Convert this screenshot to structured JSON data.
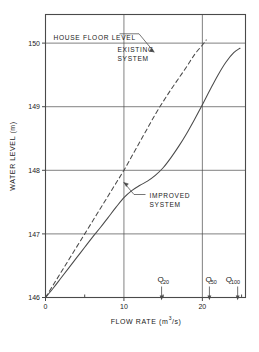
{
  "figure": {
    "background_color": "#ffffff",
    "line_color": "#4a4a4a",
    "text_color": "#1a1a1a"
  },
  "axes": {
    "y_title": "WATER LEVEL (m)",
    "x_title_main": "FLOW RATE (m",
    "x_title_sup": "3",
    "x_title_tail": "/s)",
    "x_ticks": [
      "0",
      "10",
      "20"
    ],
    "y_ticks": [
      "146",
      "147",
      "148",
      "149",
      "150"
    ]
  },
  "annotations": {
    "house_floor": "HOUSE FLOOR LEVEL",
    "existing_line1": "EXISTING",
    "existing_line2": "SYSTEM",
    "improved_line1": "IMPROVED",
    "improved_line2": "SYSTEM",
    "q20_base": "Q",
    "q20_sub": "20",
    "q50_base": "Q",
    "q50_sub": "50",
    "q100_base": "Q",
    "q100_sub": "100"
  },
  "chart_data": {
    "type": "line",
    "title": "",
    "xlabel": "FLOW RATE (m3/s)",
    "ylabel": "WATER LEVEL (m)",
    "xlim": [
      0,
      25.5
    ],
    "ylim": [
      146,
      150.45
    ],
    "xticks": [
      0,
      5,
      10,
      15,
      20,
      25
    ],
    "xtick_labels": [
      "0",
      "",
      "10",
      "",
      "20",
      ""
    ],
    "yticks": [
      146,
      147,
      148,
      149,
      150
    ],
    "ytick_labels": [
      "146",
      "147",
      "148",
      "149",
      "150"
    ],
    "grid": true,
    "grid_axis": "both",
    "legend": "none",
    "series": [
      {
        "name": "EXISTING SYSTEM",
        "style": "dashed",
        "x": [
          0,
          1,
          2,
          3,
          4,
          5,
          6,
          7,
          8,
          9,
          10,
          11,
          12,
          13,
          14,
          15,
          16,
          17,
          18,
          19,
          20,
          20.5
        ],
        "y": [
          146.0,
          146.2,
          146.4,
          146.6,
          146.8,
          147.0,
          147.2,
          147.4,
          147.6,
          147.8,
          148.0,
          148.22,
          148.44,
          148.66,
          148.88,
          149.08,
          149.27,
          149.45,
          149.63,
          149.82,
          149.97,
          150.05
        ]
      },
      {
        "name": "IMPROVED SYSTEM",
        "style": "solid",
        "x": [
          0,
          1,
          2,
          3,
          4,
          5,
          6,
          7,
          8,
          9,
          10,
          11,
          12,
          13,
          14,
          15,
          16,
          17,
          18,
          19,
          20,
          21,
          22,
          23,
          24,
          24.8
        ],
        "y": [
          146.0,
          146.15,
          146.31,
          146.47,
          146.63,
          146.79,
          146.95,
          147.1,
          147.26,
          147.42,
          147.57,
          147.68,
          147.76,
          147.83,
          147.92,
          148.04,
          148.2,
          148.38,
          148.58,
          148.8,
          149.03,
          149.27,
          149.5,
          149.7,
          149.85,
          149.92
        ]
      }
    ],
    "markers": [
      {
        "label": "Q20",
        "x": 14.8,
        "type": "down-arrow"
      },
      {
        "label": "Q50",
        "x": 20.9,
        "type": "down-arrow"
      },
      {
        "label": "Q100",
        "x": 24.5,
        "type": "down-arrow"
      }
    ],
    "reference_lines": [
      {
        "label": "HOUSE FLOOR LEVEL",
        "y": 150,
        "orientation": "horizontal"
      }
    ]
  }
}
